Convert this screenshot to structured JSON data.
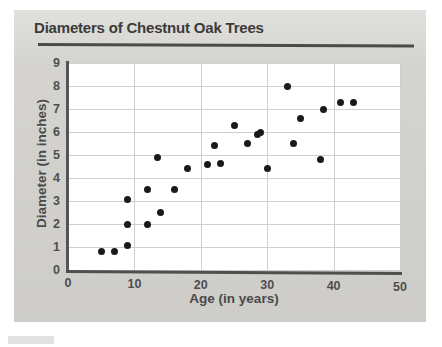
{
  "figure": {
    "title": "Diameters of Chestnut Oak Trees",
    "panel_color": "#d4d3cf",
    "plot_background": "#ffffff",
    "axis_color": "#4f4f4d",
    "grid_color": "#cfcfcf",
    "point_color": "#1a1a1a"
  },
  "chart_data": {
    "type": "scatter",
    "title": "Diameters of Chestnut Oak Trees",
    "subtitle": "",
    "xlabel": "Age (in years)",
    "ylabel": "Diameter (in inches)",
    "xlim": [
      0,
      50
    ],
    "ylim": [
      0,
      9
    ],
    "xticks": [
      0,
      10,
      20,
      30,
      40,
      50
    ],
    "xtick_labels": [
      "0",
      "10",
      "20",
      "30",
      "40",
      "50"
    ],
    "yticks": [
      0,
      1,
      2,
      3,
      4,
      5,
      6,
      7,
      8,
      9
    ],
    "ytick_labels": [
      "0",
      "1",
      "2",
      "3",
      "4",
      "5",
      "6",
      "7",
      "8",
      "9"
    ],
    "grid": true,
    "grid_axis": "both",
    "legend": false,
    "legend_position": "none",
    "marker": "circle",
    "marker_color": "#1a1a1a",
    "marker_size": 7,
    "series": [
      {
        "name": "Chestnut oak trees",
        "points": [
          {
            "x": 5,
            "y": 0.8
          },
          {
            "x": 7,
            "y": 0.8
          },
          {
            "x": 9,
            "y": 1.05
          },
          {
            "x": 9,
            "y": 2.0
          },
          {
            "x": 9,
            "y": 3.05
          },
          {
            "x": 12,
            "y": 2.0
          },
          {
            "x": 12,
            "y": 3.5
          },
          {
            "x": 13.5,
            "y": 4.9
          },
          {
            "x": 14,
            "y": 2.5
          },
          {
            "x": 16,
            "y": 3.5
          },
          {
            "x": 18,
            "y": 4.4
          },
          {
            "x": 21,
            "y": 4.6
          },
          {
            "x": 22,
            "y": 5.4
          },
          {
            "x": 23,
            "y": 4.65
          },
          {
            "x": 25,
            "y": 6.3
          },
          {
            "x": 27,
            "y": 5.5
          },
          {
            "x": 28.5,
            "y": 5.9
          },
          {
            "x": 29,
            "y": 6.0
          },
          {
            "x": 30,
            "y": 4.4
          },
          {
            "x": 33,
            "y": 8.0
          },
          {
            "x": 34,
            "y": 5.5
          },
          {
            "x": 35,
            "y": 6.6
          },
          {
            "x": 38,
            "y": 4.8
          },
          {
            "x": 38.5,
            "y": 7.0
          },
          {
            "x": 41,
            "y": 7.3
          },
          {
            "x": 43,
            "y": 7.3
          }
        ]
      }
    ]
  }
}
